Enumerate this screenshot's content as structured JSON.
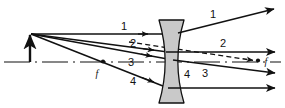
{
  "figure": {
    "background_color": "#ffffff",
    "line_color": "#111111",
    "lens_fill_color": "#c9c9c9",
    "lens_stroke_color": "#111111",
    "width": 285,
    "height": 108
  },
  "axis": {
    "name": "principal-axis",
    "style": "dash-dot",
    "y": 62,
    "x_start": 4,
    "x_end": 281
  },
  "object": {
    "name": "object-arrow",
    "x": 30,
    "base_y": 62,
    "tip_y": 33
  },
  "lens": {
    "name": "concave-lens",
    "type": "biconcave-diverging",
    "center_x": 171,
    "left_x": 159,
    "right_x": 184,
    "top_y": 20,
    "bottom_y": 103
  },
  "focal_points": [
    {
      "name": "focal-point-left",
      "label": "f",
      "x": 103,
      "y": 62,
      "label_x": 98,
      "label_y": 75
    },
    {
      "name": "focal-point-right",
      "label": "f",
      "x": 262,
      "y": 61,
      "label_x": 266,
      "label_y": 65
    }
  ],
  "ray_labels": [
    {
      "text": "1",
      "x": 124,
      "y": 30,
      "side": "incident"
    },
    {
      "text": "2",
      "x": 133,
      "y": 46,
      "side": "incident"
    },
    {
      "text": "3",
      "x": 131,
      "y": 64,
      "side": "incident"
    },
    {
      "text": "4",
      "x": 133,
      "y": 83,
      "side": "incident"
    },
    {
      "text": "1",
      "x": 213,
      "y": 17,
      "side": "refracted"
    },
    {
      "text": "2",
      "x": 223,
      "y": 46,
      "side": "refracted"
    },
    {
      "text": "3",
      "x": 205,
      "y": 76,
      "side": "refracted"
    },
    {
      "text": "4",
      "x": 187,
      "y": 77,
      "side": "refracted"
    }
  ],
  "rays": [
    {
      "name": "ray-1",
      "description": "Parallel ray strikes lens, refracts upward away from axis",
      "incident": {
        "x1": 31,
        "y1": 34,
        "x2": 164,
        "y2": 34
      },
      "refracted": {
        "x1": 164,
        "y1": 34,
        "x2": 276,
        "y2": 8
      },
      "mid_arrow": {
        "x": 146,
        "y": 34
      }
    },
    {
      "name": "ray-2",
      "description": "Ray toward far focus emerges parallel to axis",
      "incident": {
        "x1": 31,
        "y1": 34,
        "x2": 166,
        "y2": 52
      },
      "refracted": {
        "x1": 166,
        "y1": 52,
        "x2": 277,
        "y2": 52
      },
      "mid_arrow": {
        "x": 152,
        "y": 50
      }
    },
    {
      "name": "ray-3",
      "description": "Ray through lens centre continues undeviated",
      "incident": {
        "x1": 31,
        "y1": 34,
        "x2": 171,
        "y2": 60
      },
      "refracted": {
        "x1": 171,
        "y1": 60,
        "x2": 277,
        "y2": 74
      },
      "mid_arrow": {
        "x": 150,
        "y": 56
      }
    },
    {
      "name": "ray-4",
      "description": "Ray aimed at near focal point emerges parallel",
      "incident": {
        "x1": 31,
        "y1": 34,
        "x2": 166,
        "y2": 88
      },
      "refracted": {
        "x1": 166,
        "y1": 88,
        "x2": 277,
        "y2": 88
      },
      "mid_arrow": {
        "x": 152,
        "y": 83
      }
    }
  ],
  "virtual_ray": {
    "name": "virtual-ray-dashed",
    "description": "Dashed construction line running to the right focal point",
    "style": "dashed",
    "x1": 129,
    "y1": 42,
    "x2": 259,
    "y2": 61
  }
}
